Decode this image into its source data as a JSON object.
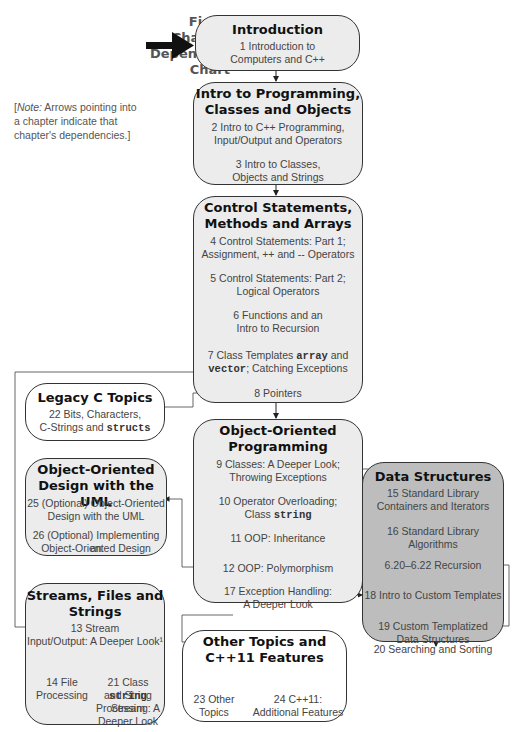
{
  "figure": {
    "title_lines": [
      "Fig. 6",
      "Chapter",
      "Dependency",
      "Chart"
    ],
    "note_prefix": "[",
    "note_italic": "Note:",
    "note_text": " Arrows pointing into a chapter indicate that chapter's dependencies.]"
  },
  "boxes": {
    "introduction": {
      "header": "Introduction",
      "items": [
        "1 Introduction to",
        "Computers and C++"
      ]
    },
    "intro_programming": {
      "header_lines": [
        "Intro to Programming,",
        "Classes and Objects"
      ],
      "items": [
        "2 Intro to C++ Programming,",
        "Input/Output and Operators",
        "3 Intro to Classes,",
        "Objects and Strings"
      ]
    },
    "control": {
      "header_lines": [
        "Control Statements,",
        "Methods and Arrays"
      ],
      "items": [
        "4 Control Statements: Part 1;",
        "Assignment, ++ and -- Operators",
        "5 Control Statements: Part 2;",
        "Logical Operators",
        "6 Functions and an",
        "Intro to Recursion",
        "7 Class Templates ",
        "array",
        " and",
        "vector",
        "; Catching Exceptions",
        "8 Pointers"
      ]
    },
    "legacy": {
      "header": "Legacy C Topics",
      "items": [
        "22 Bits, Characters,",
        "C-Strings and ",
        "structs"
      ]
    },
    "oop": {
      "header_lines": [
        "Object-Oriented",
        "Programming"
      ],
      "items": [
        "9 Classes: A Deeper Look;",
        "Throwing Exceptions",
        "10 Operator Overloading;",
        "Class ",
        "string",
        "11 OOP: Inheritance",
        "12 OOP: Polymorphism",
        "17 Exception Handling:",
        "A Deeper Look"
      ]
    },
    "uml": {
      "header_lines": [
        "Object-Oriented",
        "Design with the UML"
      ],
      "items": [
        "25 (Optional) Object-Oriented",
        "Design with the UML",
        "26 (Optional) Implementing an",
        "Object-Oriented Design"
      ]
    },
    "data_structures": {
      "header": "Data Structures",
      "items": [
        "15 Standard Library",
        "Containers and Iterators",
        "16 Standard Library Algorithms",
        "6.20–6.22 Recursion",
        "18 Intro to Custom Templates",
        "19 Custom Templatized",
        "Data Structures",
        "20 Searching and Sorting"
      ]
    },
    "streams": {
      "header_lines": [
        "Streams, Files and",
        "Strings"
      ],
      "items": [
        "13 Stream",
        "Input/Output: A Deeper Look¹",
        "14 File",
        "Processing",
        "21 Class ",
        "string",
        "and String Stream",
        "Processing: A",
        "Deeper Look"
      ]
    },
    "other": {
      "header_lines": [
        "Other Topics and",
        "C++11 Features"
      ],
      "items": [
        "23 Other",
        "Topics",
        "24 C++11:",
        "Additional Features"
      ]
    }
  },
  "colors": {
    "light_box": "#ececec",
    "dark_box": "#bdbdbd",
    "white_box": "#ffffff",
    "border": "#333333"
  }
}
